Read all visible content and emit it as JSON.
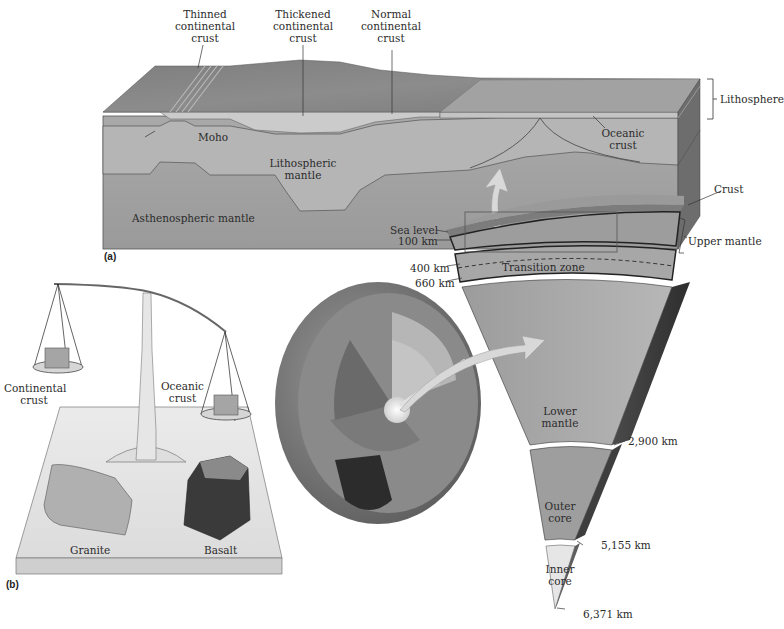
{
  "panel_a": {
    "tag": "(a)",
    "labels": {
      "thinned_crust": [
        "Thinned",
        "continental",
        "crust"
      ],
      "thickened_crust": [
        "Thickened",
        "continental",
        "crust"
      ],
      "normal_crust": [
        "Normal",
        "continental",
        "crust"
      ],
      "lithosphere": "Lithosphere",
      "moho": "Moho",
      "oceanic_crust": [
        "Oceanic",
        "crust"
      ],
      "lithospheric_mantle": [
        "Lithospheric",
        "mantle"
      ],
      "asthenospheric_mantle": "Asthenospheric mantle"
    }
  },
  "earth_section": {
    "sea_level": "Sea level",
    "depth_100": "100 km",
    "depth_400": "400 km",
    "depth_660": "660 km",
    "depth_2900": "2,900 km",
    "depth_5155": "5,155 km",
    "depth_6371": "6,371 km",
    "crust": "Crust",
    "upper_mantle": "Upper mantle",
    "transition_zone": "Transition zone",
    "lower_mantle": [
      "Lower",
      "mantle"
    ],
    "outer_core": [
      "Outer",
      "core"
    ],
    "inner_core": [
      "Inner",
      "core"
    ]
  },
  "panel_b": {
    "tag": "(b)",
    "continental_crust": [
      "Continental",
      "crust"
    ],
    "oceanic_crust": [
      "Oceanic",
      "crust"
    ],
    "granite": "Granite",
    "basalt": "Basalt"
  },
  "colors": {
    "crust_top": "#8f8f8f",
    "continental_crust": "#c6c6c6",
    "lithospheric_mantle": "#b3b3b3",
    "asthenosphere": "#a4a4a4",
    "block_side": "#6f6f6f",
    "platform": "#e4e4e4",
    "arrow": "#dcdcdc"
  }
}
